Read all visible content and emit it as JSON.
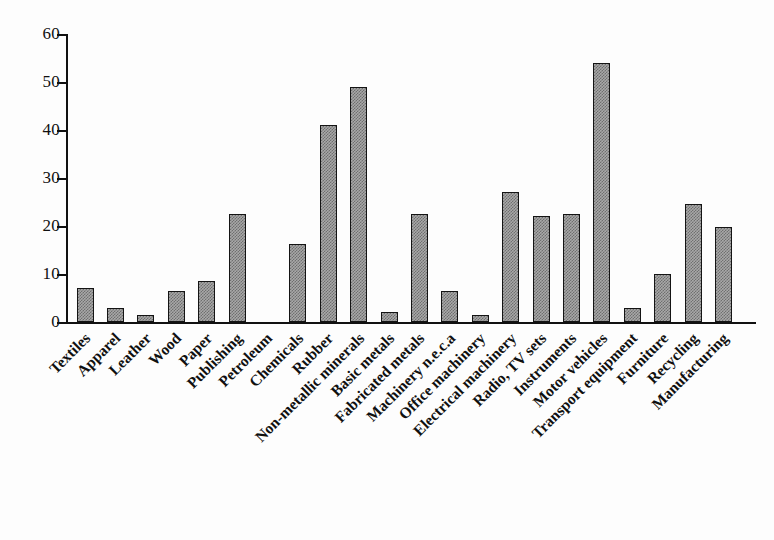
{
  "chart_data": {
    "type": "bar",
    "title": "",
    "subtitle": "",
    "xlabel": "",
    "ylabel": "",
    "ylim": [
      0,
      60
    ],
    "ytick_values": [
      0,
      10,
      20,
      30,
      40,
      50,
      60
    ],
    "ytick_labels": [
      "0",
      "10",
      "20",
      "30",
      "40",
      "50",
      "60"
    ],
    "grid": false,
    "legend": null,
    "orientation": "vertical",
    "bar_style": {
      "fill": "#a8a8a8",
      "pattern": "checkerboard-dither",
      "edge": "#141414"
    },
    "categories": [
      "Textiles",
      "Apparel",
      "Leather",
      "Wood",
      "Paper",
      "Publishing",
      "Petroleum",
      "Chemicals",
      "Rubber",
      "Non-metallic minerals",
      "Basic metals",
      "Fabricated metals",
      "Machinery n.e.c.a",
      "Office machinery",
      "Electrical machinery",
      "Radio, TV sets",
      "Instruments",
      "Motor vehicles",
      "Transport equipment",
      "Furniture",
      "Recycling",
      "Manufacturing"
    ],
    "values": [
      7,
      3,
      1.5,
      6.5,
      8.5,
      22.5,
      0,
      16.2,
      41,
      49,
      2,
      22.5,
      6.5,
      1.5,
      27,
      22,
      22.5,
      54,
      3,
      10,
      24.5,
      19.8
    ]
  }
}
